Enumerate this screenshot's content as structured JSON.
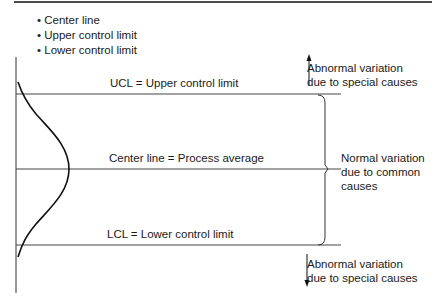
{
  "bullets": [
    "Center line",
    "Upper control limit",
    "Lower control limit"
  ],
  "lines": {
    "ucl": "UCL = Upper control limit",
    "center": "Center line = Process average",
    "lcl": "LCL = Lower control limit"
  },
  "annotations": {
    "top": [
      "Abnormal variation",
      "due to special causes"
    ],
    "middle": [
      "Normal variation",
      "due to common",
      "causes"
    ],
    "bottom": [
      "Abnormal variation",
      "due to special causes"
    ]
  },
  "colors": {
    "line": "#3a3a3a",
    "curve": "#111111",
    "text": "#1a1a1a"
  }
}
